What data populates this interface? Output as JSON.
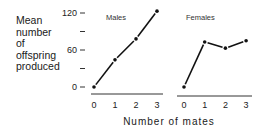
{
  "chart_data": {
    "type": "line",
    "title": "",
    "ylabel": "Mean number of offspring produced",
    "ylabel_lines": [
      "Mean",
      "number",
      "of",
      "offspring",
      "produced"
    ],
    "xlabel": "Number of mates",
    "ylim": [
      0,
      120
    ],
    "yticks": [
      0,
      30,
      60,
      90,
      120
    ],
    "ytick_labels": [
      "0",
      "",
      "60",
      "",
      "120"
    ],
    "grid": false,
    "panels": [
      {
        "title": "Males",
        "x": [
          0,
          1,
          2,
          3
        ],
        "xtick_labels": [
          "0",
          "1",
          "2",
          "3"
        ],
        "values": [
          0,
          44,
          78,
          123
        ]
      },
      {
        "title": "Females",
        "x": [
          0,
          1,
          2,
          3
        ],
        "xtick_labels": [
          "0",
          "1",
          "2",
          "3"
        ],
        "values": [
          0,
          73,
          63,
          75
        ]
      }
    ]
  }
}
